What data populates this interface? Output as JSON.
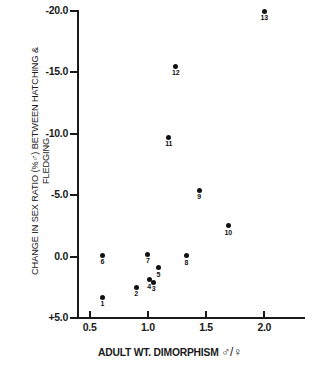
{
  "chart_data": {
    "type": "scatter",
    "title": "",
    "xlabel": "ADULT WT. DIMORPHISM ♂/♀",
    "ylabel_line1": "CHANGE IN SEX RATIO (%♂) BETWEEN HATCHING &",
    "ylabel_line2": "FLEDGING",
    "xlim": [
      0.4,
      2.35
    ],
    "ylim": [
      5.0,
      -20.0
    ],
    "y_axis_inverted": true,
    "grid": false,
    "legend": "none",
    "xticks": [
      "0.5",
      "1.0",
      "1.5",
      "2.0"
    ],
    "xtick_values": [
      0.5,
      1.0,
      1.5,
      2.0
    ],
    "yticks": [
      "+5.0",
      "0.0",
      "-5.0",
      "-10.0",
      "-15.0",
      "-20.0"
    ],
    "ytick_values": [
      5.0,
      0.0,
      -5.0,
      -10.0,
      -15.0,
      -20.0
    ],
    "point_labels": [
      "1",
      "2",
      "3",
      "4",
      "5",
      "6",
      "7",
      "8",
      "9",
      "10",
      "11",
      "12",
      "13"
    ],
    "x": [
      0.61,
      0.9,
      1.05,
      1.01,
      1.09,
      0.61,
      1.0,
      1.33,
      1.44,
      1.69,
      1.18,
      1.24,
      2.0
    ],
    "y": [
      3.3,
      2.5,
      2.1,
      1.9,
      0.9,
      -0.1,
      -0.2,
      -0.05,
      -5.4,
      -2.5,
      -9.7,
      -15.5,
      -20.0
    ],
    "points": [
      {
        "label": "1",
        "x": 0.61,
        "y": 3.3
      },
      {
        "label": "2",
        "x": 0.9,
        "y": 2.5
      },
      {
        "label": "3",
        "x": 1.05,
        "y": 2.1
      },
      {
        "label": "4",
        "x": 1.01,
        "y": 1.9
      },
      {
        "label": "5",
        "x": 1.09,
        "y": 0.9
      },
      {
        "label": "6",
        "x": 0.61,
        "y": -0.1
      },
      {
        "label": "7",
        "x": 1.0,
        "y": -0.2
      },
      {
        "label": "8",
        "x": 1.33,
        "y": -0.05
      },
      {
        "label": "9",
        "x": 1.44,
        "y": -5.4
      },
      {
        "label": "10",
        "x": 1.69,
        "y": -2.5
      },
      {
        "label": "11",
        "x": 1.18,
        "y": -9.7
      },
      {
        "label": "12",
        "x": 1.24,
        "y": -15.5
      },
      {
        "label": "13",
        "x": 2.0,
        "y": -20.0
      }
    ],
    "marker_color": "#111111",
    "axis_color": "#1a1a1a"
  }
}
